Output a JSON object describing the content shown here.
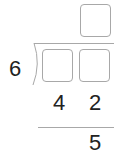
{
  "division": {
    "divisor": "6",
    "quotient_boxes": [
      ""
    ],
    "dividend_boxes": [
      "",
      ""
    ],
    "subtract_row": [
      "4",
      "2"
    ],
    "remainder": "5"
  }
}
